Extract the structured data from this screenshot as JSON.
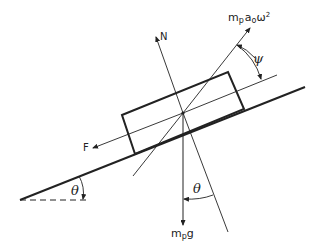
{
  "diagram": {
    "type": "free-body diagram",
    "labels": {
      "normal_force": "N",
      "friction_force": "F",
      "centrifugal_force_base": "m",
      "centrifugal_force_sub": "p",
      "centrifugal_force_rest": "a",
      "centrifugal_force_sub2": "o",
      "centrifugal_force_omega": "ω",
      "centrifugal_force_sup": "2",
      "weight_base": "m",
      "weight_sub": "p",
      "weight_rest": "g",
      "incline_angle": "θ",
      "weight_angle": "θ",
      "force_angle": "ψ"
    },
    "colors": {
      "line": "#222222",
      "background": "#ffffff"
    }
  }
}
